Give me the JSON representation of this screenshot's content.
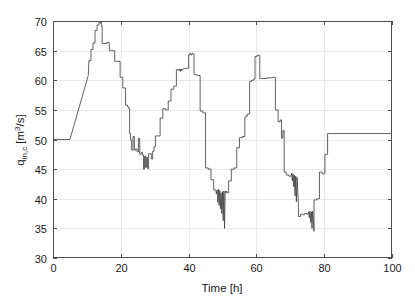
{
  "chart_data": {
    "type": "line",
    "title": "",
    "xlabel": "Time [h]",
    "ylabel": "q_in,c  [m^3/s]",
    "ylabel_base": "q",
    "ylabel_sub": "in,c",
    "ylabel_unit_pre": " [m",
    "ylabel_unit_sup": "3",
    "ylabel_unit_post": "/s]",
    "xlim": [
      0,
      100
    ],
    "ylim": [
      30,
      70
    ],
    "xticks": [
      0,
      20,
      40,
      60,
      80,
      100
    ],
    "yticks": [
      30,
      35,
      40,
      45,
      50,
      55,
      60,
      65,
      70
    ],
    "xtick_labels": [
      "0",
      "20",
      "40",
      "60",
      "80",
      "100"
    ],
    "ytick_labels": [
      "30",
      "35",
      "40",
      "45",
      "50",
      "55",
      "60",
      "65",
      "70"
    ],
    "grid": true,
    "legend": null,
    "line_color": "#3a3a3a",
    "grid_color": "#e8e8e8",
    "axis_color": "#4d4d4d",
    "series": [
      {
        "name": "q_in,c",
        "x": [
          0.0,
          5.0,
          5.6,
          6.2,
          6.8,
          7.4,
          8.0,
          8.6,
          9.2,
          9.8,
          10.4,
          10.6,
          10.6,
          11.2,
          11.2,
          11.8,
          11.8,
          12.4,
          12.4,
          13.0,
          13.0,
          13.5,
          13.6,
          13.8,
          14.0,
          14.2,
          14.3,
          14.5,
          14.5,
          15.2,
          15.2,
          15.9,
          15.9,
          16.6,
          16.6,
          17.3,
          17.3,
          18.2,
          18.2,
          19.0,
          19.0,
          19.8,
          19.8,
          20.6,
          20.6,
          21.4,
          21.4,
          22.0,
          22.0,
          22.3,
          22.3,
          22.6,
          22.6,
          22.9,
          22.9,
          23.2,
          23.2,
          23.6,
          23.6,
          24.0,
          24.0,
          24.4,
          24.4,
          24.8,
          24.8,
          25.2,
          25.2,
          25.6,
          25.6,
          26.0,
          26.0,
          26.4,
          26.4,
          26.7,
          26.7,
          27.0,
          27.0,
          27.3,
          27.3,
          27.6,
          27.6,
          27.9,
          27.9,
          28.2,
          28.2,
          28.6,
          28.6,
          29.0,
          29.0,
          29.4,
          29.4,
          29.8,
          29.8,
          30.2,
          30.2,
          30.8,
          30.8,
          31.6,
          31.6,
          32.4,
          32.4,
          33.2,
          33.2,
          34.0,
          34.0,
          34.8,
          34.8,
          35.6,
          35.6,
          36.4,
          36.4,
          37.0,
          37.2,
          37.4,
          37.6,
          37.8,
          38.0,
          38.3,
          38.6,
          38.9,
          39.2,
          39.5,
          39.8,
          40.0,
          40.0,
          40.4,
          40.4,
          40.7,
          40.7,
          41.0,
          41.0,
          41.3,
          41.3,
          41.6,
          41.6,
          42.0,
          42.0,
          42.6,
          42.6,
          43.4,
          43.4,
          44.2,
          44.2,
          45.0,
          45.0,
          45.8,
          45.8,
          46.6,
          46.6,
          47.4,
          47.4,
          48.0,
          48.2,
          48.4,
          48.6,
          48.8,
          49.0,
          49.2,
          49.4,
          49.6,
          49.8,
          50.0,
          50.2,
          50.4,
          50.6,
          50.8,
          51.0,
          51.2,
          51.4,
          51.8,
          51.8,
          52.6,
          52.6,
          53.4,
          53.4,
          54.2,
          54.2,
          55.0,
          55.0,
          55.8,
          55.8,
          56.6,
          56.6,
          57.0,
          57.0,
          57.4,
          57.4,
          58.0,
          58.0,
          58.6,
          58.6,
          59.2,
          59.2,
          59.6,
          59.6,
          60.2,
          60.2,
          61.0,
          61.0,
          62.0,
          62.0,
          63.0,
          63.0,
          64.0,
          64.0,
          64.8,
          64.8,
          65.6,
          65.6,
          66.4,
          66.4,
          67.0,
          67.0,
          67.4,
          67.4,
          67.8,
          67.8,
          68.2,
          68.2,
          68.8,
          68.8,
          69.6,
          69.6,
          70.2,
          70.4,
          70.6,
          70.8,
          71.0,
          71.2,
          71.4,
          71.6,
          71.8,
          72.0,
          72.4,
          72.4,
          73.0,
          73.0,
          73.6,
          73.6,
          74.2,
          74.2,
          74.8,
          74.8,
          75.2,
          75.4,
          75.6,
          75.8,
          76.0,
          76.2,
          76.4,
          76.6,
          77.0,
          77.0,
          77.8,
          77.8,
          78.6,
          78.6,
          79.4,
          79.4,
          80.2,
          80.2,
          81.0,
          81.0,
          81.8,
          81.8,
          100.0
        ],
        "y": [
          50.0,
          50.0,
          51.2,
          52.4,
          53.6,
          54.8,
          56.0,
          57.2,
          58.4,
          59.6,
          60.8,
          63.3,
          63.3,
          63.3,
          65.2,
          65.2,
          66.3,
          66.3,
          68.4,
          68.4,
          69.3,
          69.3,
          69.9,
          70.0,
          69.6,
          69.9,
          69.2,
          69.2,
          66.2,
          66.2,
          66.2,
          66.2,
          66.4,
          66.4,
          65.0,
          65.0,
          65.0,
          65.0,
          63.2,
          63.2,
          63.2,
          63.2,
          60.5,
          60.5,
          58.7,
          58.7,
          55.8,
          55.8,
          55.5,
          55.5,
          55.2,
          55.2,
          51.0,
          51.0,
          49.9,
          49.9,
          48.2,
          48.2,
          50.5,
          50.5,
          48.2,
          48.2,
          48.4,
          48.4,
          47.9,
          47.9,
          50.2,
          50.2,
          47.5,
          47.5,
          47.8,
          47.8,
          47.4,
          47.4,
          45.0,
          45.0,
          47.2,
          47.2,
          45.3,
          45.3,
          47.0,
          47.0,
          45.1,
          45.1,
          47.6,
          47.6,
          47.6,
          47.6,
          46.7,
          46.7,
          48.0,
          48.0,
          48.8,
          48.8,
          50.6,
          50.6,
          50.6,
          50.6,
          53.6,
          53.6,
          55.2,
          55.2,
          55.0,
          55.0,
          56.5,
          56.5,
          58.5,
          58.5,
          59.0,
          59.0,
          61.8,
          61.8,
          61.6,
          61.9,
          61.5,
          61.9,
          61.6,
          61.9,
          62.0,
          62.0,
          62.0,
          62.0,
          62.0,
          62.0,
          64.3,
          64.3,
          64.5,
          64.5,
          64.3,
          64.3,
          64.5,
          64.5,
          64.4,
          64.4,
          61.0,
          61.0,
          60.9,
          60.9,
          60.8,
          60.8,
          54.8,
          54.8,
          54.5,
          54.5,
          45.2,
          45.2,
          45.0,
          45.0,
          43.2,
          43.2,
          41.5,
          41.5,
          40.8,
          41.5,
          39.4,
          41.6,
          38.9,
          41.4,
          38.3,
          41.0,
          37.5,
          41.2,
          36.3,
          41.3,
          35.0,
          41.3,
          41.0,
          41.3,
          41.0,
          41.0,
          43.0,
          43.0,
          45.0,
          45.0,
          45.2,
          45.2,
          48.6,
          48.6,
          50.3,
          50.3,
          50.5,
          50.5,
          53.8,
          53.8,
          54.0,
          54.0,
          54.3,
          54.3,
          59.8,
          59.8,
          60.0,
          60.0,
          60.2,
          60.2,
          64.0,
          64.0,
          64.2,
          64.2,
          60.3,
          60.3,
          60.3,
          60.3,
          60.4,
          60.4,
          60.4,
          60.4,
          60.5,
          60.5,
          55.0,
          55.0,
          53.0,
          53.0,
          53.3,
          53.3,
          50.2,
          50.2,
          51.5,
          51.5,
          44.5,
          44.5,
          44.0,
          44.0,
          43.8,
          43.8,
          44.3,
          43.0,
          44.2,
          42.0,
          44.0,
          40.5,
          43.8,
          39.5,
          43.6,
          39.0,
          37.0,
          37.0,
          37.4,
          37.4,
          37.3,
          37.3,
          37.5,
          37.5,
          37.4,
          37.4,
          37.8,
          36.8,
          37.9,
          36.0,
          37.8,
          35.0,
          37.9,
          34.5,
          39.8,
          39.8,
          40.0,
          40.0,
          44.5,
          44.5,
          44.2,
          44.2,
          47.5,
          47.5,
          51.0,
          51.0,
          51.0,
          51.0
        ]
      }
    ]
  },
  "figure": {
    "background": "#ffffff",
    "plot_left_px": 53,
    "plot_right_px": 392,
    "plot_top_px": 21,
    "plot_bottom_px": 258
  }
}
